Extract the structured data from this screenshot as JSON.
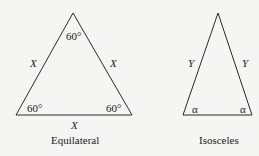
{
  "equilateral": {
    "caption": "Equilateral",
    "side_labels": [
      "X",
      "X",
      "X"
    ],
    "angle_labels": {
      "top": "60°",
      "left": "60°",
      "right": "60°"
    }
  },
  "isosceles": {
    "caption": "Isosceles",
    "side_labels": [
      "Y",
      "Y"
    ],
    "angle_labels": {
      "left": "α",
      "right": "α"
    }
  },
  "colors": {
    "line": "#2a2a2a",
    "background": "#f5f5f3"
  }
}
